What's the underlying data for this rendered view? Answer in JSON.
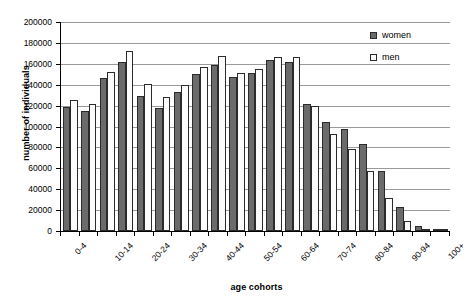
{
  "chart_data": {
    "type": "bar",
    "title": "",
    "xlabel": "age cohorts",
    "ylabel": "number of individuals",
    "ylim": [
      0,
      200000
    ],
    "ytick_step": 20000,
    "yticks": [
      0,
      20000,
      40000,
      60000,
      80000,
      100000,
      120000,
      140000,
      160000,
      180000,
      200000
    ],
    "ytick_labels": [
      "0",
      "20000",
      "40000",
      "60000",
      "80000",
      "100000",
      "120000",
      "140000",
      "160000",
      "180000",
      "200000"
    ],
    "grid": true,
    "grid_axis": "y",
    "legend_position": "top-right",
    "categories": [
      "0-4",
      "5-9",
      "10-14",
      "15-19",
      "20-24",
      "25-29",
      "30-34",
      "35-39",
      "40-44",
      "45-49",
      "50-54",
      "55-59",
      "60-64",
      "65-69",
      "70-74",
      "75-79",
      "80-84",
      "85-89",
      "90-94",
      "95-99",
      "100+"
    ],
    "visible_tick_labels": [
      "0-4",
      "10-14",
      "20-24",
      "30-34",
      "40-44",
      "50-54",
      "60-64",
      "70-74",
      "80-84",
      "90-94",
      "100+"
    ],
    "series": [
      {
        "name": "women",
        "color": "#6b6b6b",
        "values": [
          119000,
          114500,
          146000,
          161500,
          129000,
          117500,
          133500,
          150000,
          159000,
          147000,
          151500,
          163500,
          161500,
          122000,
          104500,
          98000,
          83500,
          57000,
          23000,
          4800,
          500
        ]
      },
      {
        "name": "men",
        "color": "#fcfcfc",
        "values": [
          125000,
          121500,
          152500,
          172000,
          140500,
          128000,
          139500,
          156500,
          167500,
          151500,
          155500,
          167000,
          166500,
          120000,
          93000,
          78500,
          57500,
          31500,
          9500,
          1200,
          200
        ]
      }
    ]
  },
  "legend": {
    "items": [
      {
        "label": "women",
        "swatch": "filled-dark-square"
      },
      {
        "label": "men",
        "swatch": "empty-white-square"
      }
    ]
  },
  "axes": {
    "y_title": "number of individuals",
    "x_title": "age cohorts"
  }
}
